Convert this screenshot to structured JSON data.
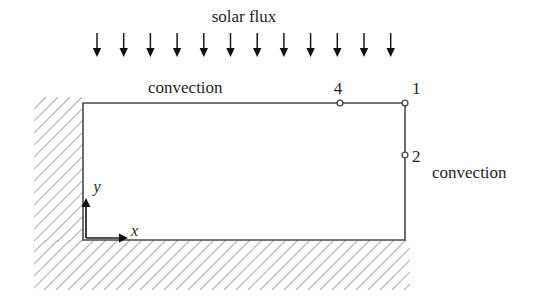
{
  "figure": {
    "title": "solar flux",
    "top_boundary_label": "convection",
    "right_boundary_label": "convection",
    "axes": {
      "x_label": "x",
      "y_label": "y",
      "origin_x": 86,
      "origin_y": 238
    },
    "nodes": [
      {
        "id": "node-4",
        "label": "4",
        "x": 340,
        "y": 103,
        "label_x": 338,
        "label_y": 94
      },
      {
        "id": "node-1",
        "label": "1",
        "x": 405,
        "y": 103,
        "label_x": 412,
        "label_y": 94
      },
      {
        "id": "node-2",
        "label": "2",
        "x": 405,
        "y": 155,
        "label_x": 412,
        "label_y": 162
      }
    ],
    "plate": {
      "left": 83,
      "top": 103,
      "right": 405,
      "bottom": 240
    },
    "flux_arrows": {
      "count": 12,
      "first_x": 97,
      "spacing": 26.7,
      "top_y": 33,
      "bottom_y": 57
    },
    "hatching": {
      "left_region": {
        "x": 34,
        "y": 97,
        "width": 49,
        "height": 145
      },
      "bottom_region": {
        "x": 34,
        "y": 240,
        "width": 376,
        "height": 50
      },
      "spacing": 12,
      "color": "#b4b4b4"
    },
    "colors": {
      "background": "#ffffff",
      "outline": "#4a4a4a",
      "arrow": "#101010",
      "text": "#1f1f1f",
      "hatch": "#b4b4b4"
    }
  }
}
